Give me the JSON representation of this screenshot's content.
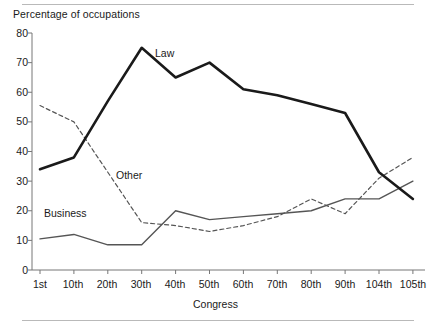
{
  "chart_data": {
    "type": "line",
    "title": "",
    "ylabel": "Percentage of occupations",
    "xlabel": "Congress",
    "categories": [
      "1st",
      "10th",
      "20th",
      "30th",
      "40th",
      "50th",
      "60th",
      "70th",
      "80th",
      "90th",
      "104th",
      "105th"
    ],
    "ylim": [
      0,
      80
    ],
    "yticks": [
      0,
      10,
      20,
      30,
      40,
      50,
      60,
      70,
      80
    ],
    "ytick_labels": [
      "0",
      "10",
      "20",
      "30",
      "40",
      "50",
      "60",
      "70",
      "80"
    ],
    "grid": false,
    "legend": "inline-annotations",
    "series": [
      {
        "name": "Law",
        "style": "solid-thick",
        "color": "#1a1a1a",
        "values": [
          34,
          38,
          57,
          75,
          65,
          70,
          61,
          59,
          56,
          53,
          33,
          24
        ]
      },
      {
        "name": "Other",
        "style": "dashed",
        "color": "#555555",
        "values": [
          55.5,
          50,
          33,
          16,
          15,
          13,
          15,
          18,
          24,
          19,
          31,
          38
        ]
      },
      {
        "name": "Business",
        "style": "solid-thin",
        "color": "#555555",
        "values": [
          10.5,
          12,
          8.5,
          8.5,
          20,
          17,
          18,
          19,
          20,
          24,
          24,
          30
        ]
      }
    ],
    "annotations": [
      {
        "text": "Law",
        "x": 185,
        "y": 54
      },
      {
        "text": "Other",
        "x": 120,
        "y": 174
      },
      {
        "text": "Business",
        "x": 45,
        "y": 212
      }
    ]
  }
}
